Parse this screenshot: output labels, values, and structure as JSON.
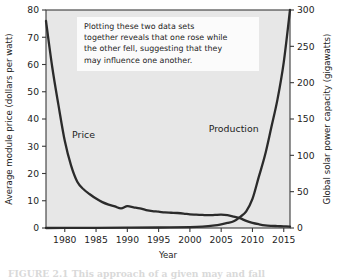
{
  "figure": {
    "caption": "FIGURE 2.1 This approach of a given may and fall",
    "caption_visible_note": "cropped"
  },
  "chart_data": {
    "type": "line",
    "title": "",
    "xlabel": "Year",
    "ylabel": "Average module price (dollars per watt)",
    "y2label": "Global solar power capacity (gigawatts)",
    "xlim": [
      1977,
      2016
    ],
    "ylim": [
      0,
      80
    ],
    "y2lim": [
      0,
      300
    ],
    "xticks": [
      1980,
      1985,
      1990,
      1995,
      2000,
      2005,
      2010,
      2015
    ],
    "xticklabels": [
      "1980",
      "1985",
      "1990",
      "1995",
      "2000",
      "2005",
      "2010",
      "2015"
    ],
    "yticks": [
      0,
      10,
      20,
      30,
      40,
      50,
      60,
      70,
      80
    ],
    "yticklabels": [
      "0",
      "10",
      "20",
      "30",
      "40",
      "50",
      "60",
      "70",
      "80"
    ],
    "y2ticks": [
      0,
      50,
      100,
      150,
      200,
      250,
      300
    ],
    "y2ticklabels": [
      "0",
      "50",
      "100",
      "150",
      "200",
      "250",
      "300"
    ],
    "grid": false,
    "legend": "inline-labels",
    "background": "#e7e7e7",
    "line_color": "#2b2b2b",
    "series": [
      {
        "name": "Price",
        "axis": "left",
        "units": "dollars per watt",
        "label_x": 1983,
        "label_y": 33,
        "x": [
          1977,
          1978,
          1979,
          1980,
          1981,
          1982,
          1983,
          1984,
          1985,
          1986,
          1987,
          1988,
          1989,
          1990,
          1991,
          1992,
          1993,
          1994,
          1995,
          1996,
          1997,
          1998,
          1999,
          2000,
          2001,
          2002,
          2003,
          2004,
          2005,
          2006,
          2007,
          2008,
          2009,
          2010,
          2011,
          2012,
          2013,
          2014,
          2015,
          2016
        ],
        "y": [
          76.0,
          59.0,
          45.0,
          32.0,
          23.0,
          17.0,
          14.2,
          12.4,
          10.8,
          9.5,
          8.6,
          7.9,
          7.2,
          8.0,
          7.6,
          7.2,
          6.6,
          6.2,
          6.0,
          5.7,
          5.6,
          5.5,
          5.3,
          5.0,
          4.9,
          4.8,
          4.7,
          4.8,
          4.9,
          4.7,
          4.2,
          3.6,
          2.6,
          1.9,
          1.4,
          1.0,
          0.8,
          0.7,
          0.6,
          0.5
        ]
      },
      {
        "name": "Production",
        "axis": "right",
        "units": "gigawatts",
        "label_x": 2007,
        "label_y": 132,
        "x": [
          1977,
          1980,
          1985,
          1990,
          1995,
          2000,
          2002,
          2004,
          2005,
          2006,
          2007,
          2008,
          2009,
          2010,
          2011,
          2012,
          2013,
          2014,
          2015,
          2016
        ],
        "y": [
          0.0,
          0.1,
          0.2,
          0.4,
          0.7,
          1.3,
          2.0,
          3.7,
          5.1,
          6.9,
          9.2,
          15.0,
          23.0,
          40.0,
          70.0,
          100.0,
          138.0,
          177.0,
          228.0,
          300.0
        ]
      }
    ],
    "annotation": {
      "lines": [
        "Plotting these two data sets",
        "together reveals that one rose while",
        "the other fell, suggesting that they",
        "may influence one another."
      ]
    }
  }
}
